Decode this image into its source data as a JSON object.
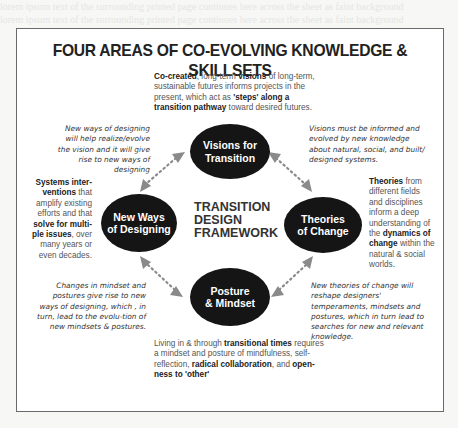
{
  "title": "FOUR AREAS OF CO-EVOLVING KNOWLEDGE & SKILLSETS",
  "center": {
    "line1": "TRANSITION",
    "line2": "DESIGN",
    "line3": "FRAMEWORK"
  },
  "nodes": {
    "visions": {
      "line1": "Visions for",
      "line2": "Transition"
    },
    "new_ways": {
      "line1": "New Ways",
      "line2": "of Designing"
    },
    "theories": {
      "line1": "Theories",
      "line2": "of Change"
    },
    "posture": {
      "line1": "Posture",
      "line2": "& Mindset"
    }
  },
  "descriptions": {
    "visions": {
      "b1": "Co-created",
      "t1": ", long-term ",
      "b2": "visions",
      "t2": " of long-term, sustainable futures informs projects in the present, which act as ",
      "b3": "'steps' along a transition pathway",
      "t3": " toward desired futures."
    },
    "new_ways": {
      "b1": "Systems inter-ventions",
      "t1": " that amplify existing efforts and that ",
      "b2": "solve for multi-ple issues",
      "t2": ", over many years or even decades."
    },
    "theories": {
      "b1": "Theories",
      "t1": " from different fields and disciplines inform a deep understanding of the ",
      "b2": "dynamics of change",
      "t2": " within the natural & social worlds."
    },
    "posture": {
      "t1": "Living in & through ",
      "b1": "transitional times",
      "t2": " requires a mindset and posture of mindfulness, self-reflection, ",
      "b2": "radical collaboration",
      "t3": ", and ",
      "b3": "open-ness to 'other'"
    }
  },
  "relations": {
    "top_left": "New ways of designing will help realize/evolve the vision and it will give rise to new ways of designing",
    "top_right": "Visions must be informed and evolved by new knowledge about natural, social, and built/ designed systems.",
    "bottom_left": "Changes in mindset and postures give rise to new ways of designing, which , in turn, lead to the evolu-tion of new mindsets & postures.",
    "bottom_right": "New theories of change will reshape designers' temperaments, mindsets and postures, which in turn lead to searches for new and relevant knowledge."
  },
  "colors": {
    "node_fill": "#151515",
    "arrow": "#8a8a8a",
    "frame": "#6a6a6a",
    "center_text": "#333333"
  }
}
